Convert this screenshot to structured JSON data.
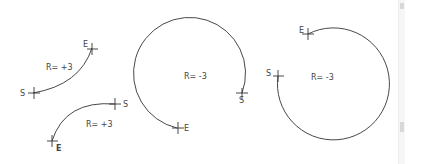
{
  "diagram": {
    "title": "",
    "arcs": [
      {
        "id": "arc-1",
        "radius_label": "R= +3",
        "start_label": "S",
        "end_label": "E",
        "type": "open-arc"
      },
      {
        "id": "arc-2",
        "radius_label": "R= +3",
        "start_label": "S",
        "end_label": "E",
        "type": "open-arc"
      },
      {
        "id": "arc-3",
        "radius_label": "R= -3",
        "start_label": "S",
        "end_label": "E",
        "type": "near-full-circle"
      },
      {
        "id": "arc-4",
        "radius_label": "R= -3",
        "start_label": "S",
        "end_label": "E",
        "type": "near-full-circle"
      }
    ],
    "colors": {
      "line": "#333333",
      "text": "#444444",
      "background": "#ffffff"
    }
  },
  "scrollbar": {
    "orientation": "vertical"
  }
}
